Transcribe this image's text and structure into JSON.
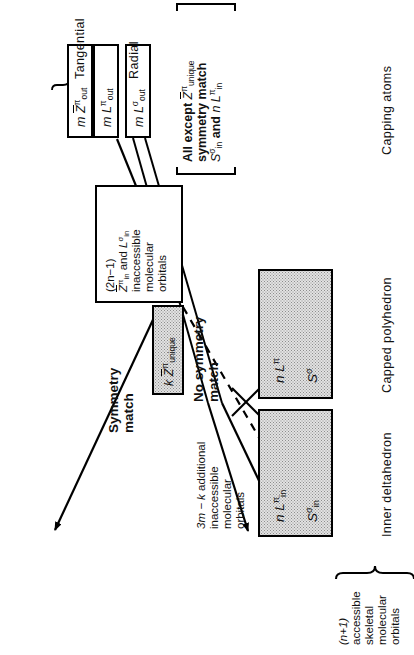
{
  "figure": {
    "orientation": "rotated-90-ccw",
    "ink_color": "#000000",
    "shade_color": "#e2e2e2"
  },
  "captions": {
    "inner_deltahedron": "Inner deltahedron",
    "capped_polyhedron": "Capped  polyhedron",
    "capping_atoms": "Capping atoms"
  },
  "inaccessible_box": {
    "line1": "(2n−1)",
    "line2_a": "Z",
    "line2_sup": "π",
    "line2_sub": "in",
    "line2_b": " and ",
    "line2_c": "L",
    "line2_c_sup": "σ",
    "line2_c_sub": "in",
    "line3": "inaccessible",
    "line4": "molecular",
    "line5": "orbitals"
  },
  "inner_deltahedron_box": {
    "top_label_n": "n",
    "top_label_L": "L",
    "top_label_sup": "π",
    "top_label_sub": "in",
    "bottom_label_S": "S",
    "bottom_label_sup": "σ",
    "bottom_label_sub": "in"
  },
  "capped_polyhedron_box": {
    "top_label_n": "n",
    "top_label_L": "L",
    "top_label_sup": "π",
    "bottom_label_S": "S",
    "bottom_label_sup": "σ"
  },
  "unique_box": {
    "k": "k",
    "Z": "Z",
    "sup": "π",
    "sub": "unique"
  },
  "capping_boxes": [
    {
      "m": "m",
      "sym": "Z",
      "overline": true,
      "sup": "π",
      "sub": "out"
    },
    {
      "m": "m",
      "sym": "L",
      "overline": false,
      "sup": "π",
      "sub": "out"
    },
    {
      "m": "m",
      "sym": "L",
      "overline": false,
      "sup": "σ",
      "sub": "out"
    }
  ],
  "capping_group_labels": {
    "tangential": "Tangential",
    "radial": "Radial"
  },
  "accessible_brace": {
    "line1": "(n+1)",
    "line2": "accessible",
    "line3": "skeletal",
    "line4": "molecular",
    "line5": "orbitals"
  },
  "additional_inaccessible": {
    "line1_a": "3m − k",
    "line1_b": " additional",
    "line2": "inaccessible",
    "line3": "molecular",
    "line4": "orbitals"
  },
  "bracket_note": {
    "l1_a": "All except ",
    "l1_Z": "Z",
    "l1_sup": "π",
    "l1_sub": "unique",
    "l2": "symmetry  match",
    "l3_S": "S",
    "l3_S_sup": "σ",
    "l3_S_sub": "in",
    "l3_mid": " and  ",
    "l3_n": "n",
    "l3_L": "L",
    "l3_L_sup": "π",
    "l3_L_sub": "in"
  },
  "edge_labels": {
    "symmetry_match_l1": "Symmetry",
    "symmetry_match_l2": "match",
    "no_symmetry_match_l1": "No symmetry",
    "no_symmetry_match_l2": "match"
  }
}
